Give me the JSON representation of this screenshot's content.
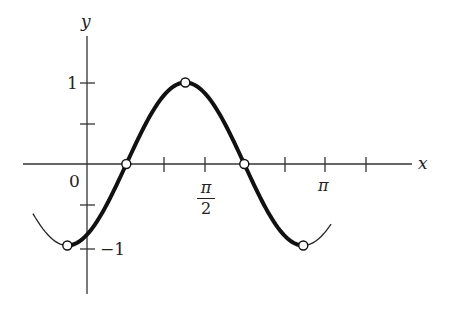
{
  "chart_data": {
    "type": "line",
    "title": "",
    "function": "y = sin(2x - π/3)",
    "xlabel": "x",
    "ylabel": "y",
    "xlim": [
      -0.85,
      4.4
    ],
    "ylim": [
      -1.6,
      1.7
    ],
    "grid": false,
    "legend": null,
    "x_ticks": [
      {
        "value": 1.0472,
        "label": ""
      },
      {
        "value": 1.5708,
        "label": "π/2"
      },
      {
        "value": 2.618,
        "label": ""
      },
      {
        "value": 3.1416,
        "label": "π"
      },
      {
        "value": 3.6652,
        "label": ""
      }
    ],
    "y_ticks": [
      {
        "value": 1,
        "label": "1"
      },
      {
        "value": 0.5,
        "label": ""
      },
      {
        "value": -0.5,
        "label": ""
      },
      {
        "value": -1,
        "label": "-1"
      }
    ],
    "origin_label": "0",
    "series": [
      {
        "name": "highlighted period (thick)",
        "x_range": [
          -0.2618,
          2.8798
        ],
        "style": "thick"
      },
      {
        "name": "extension (thin)",
        "x_range": [
          -0.72,
          3.25
        ],
        "style": "thin"
      }
    ],
    "marked_points": [
      {
        "x": -0.2618,
        "y": -1,
        "label": "min"
      },
      {
        "x": 0.5236,
        "y": 0,
        "label": "zero"
      },
      {
        "x": 1.309,
        "y": 1,
        "label": "max"
      },
      {
        "x": 2.0944,
        "y": 0,
        "label": "zero"
      },
      {
        "x": 2.8798,
        "y": -1,
        "label": "min"
      }
    ]
  },
  "labels": {
    "y_axis": "y",
    "x_axis": "x",
    "origin": "0",
    "y_one": "1",
    "y_neg_one": "−1",
    "pi_half_num": "π",
    "pi_half_den": "2",
    "pi": "π"
  },
  "colors": {
    "curve": "#111111",
    "axis": "#333333",
    "marker_fill": "#ffffff"
  }
}
